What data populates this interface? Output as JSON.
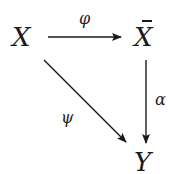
{
  "diagram": {
    "type": "commutative-diagram",
    "nodes": {
      "x": "X",
      "xbar": "X",
      "y": "Y"
    },
    "arrows": {
      "phi": {
        "from": "X",
        "to": "X̄",
        "label": "φ"
      },
      "alpha": {
        "from": "X̄",
        "to": "Y",
        "label": "α"
      },
      "psi": {
        "from": "X",
        "to": "Y",
        "label": "ψ"
      }
    },
    "colors": {
      "ink": "#1a1a1a",
      "background": "#ffffff"
    }
  }
}
